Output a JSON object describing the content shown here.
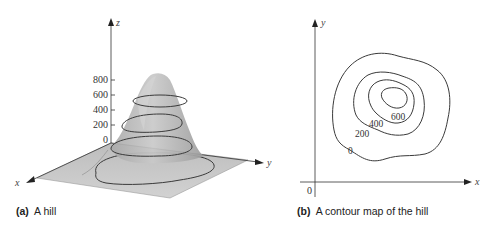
{
  "figure": {
    "panel_a": {
      "caption_tag": "(a)",
      "caption_text": "A hill",
      "axes": {
        "x": "x",
        "y": "y",
        "z": "z"
      },
      "z_ticks": [
        "800",
        "600",
        "400",
        "200",
        "0"
      ]
    },
    "panel_b": {
      "caption_tag": "(b)",
      "caption_text": "A contour map of the hill",
      "axes": {
        "x": "x",
        "y": "y",
        "origin": "0"
      },
      "contour_labels": [
        "0",
        "200",
        "400",
        "600"
      ]
    }
  },
  "colors": {
    "surface_fill": "#b8b8b8",
    "plane_fill": "#c4c4c4",
    "contour_line": "#3a3a3a",
    "axis_line": "#333333"
  }
}
